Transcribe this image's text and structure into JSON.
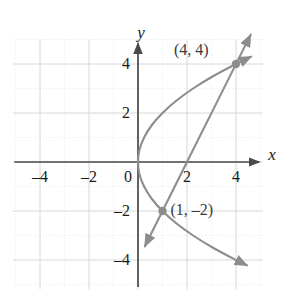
{
  "chart_data": {
    "type": "line",
    "title": "",
    "xlabel": "x",
    "ylabel": "y",
    "xlim": [
      -5.1,
      5.1
    ],
    "ylim": [
      -5.2,
      5.0
    ],
    "grid": true,
    "grid_major_step": 2,
    "grid_minor_step": 1,
    "legend": "none",
    "x_ticks": [
      {
        "value": -4,
        "label": "–4"
      },
      {
        "value": -2,
        "label": "–2"
      },
      {
        "value": 0,
        "label": "0"
      },
      {
        "value": 2,
        "label": "2"
      },
      {
        "value": 4,
        "label": "4"
      }
    ],
    "y_ticks": [
      {
        "value": 4,
        "label": "4"
      },
      {
        "value": 2,
        "label": "2"
      },
      {
        "value": -2,
        "label": "–2"
      },
      {
        "value": -4,
        "label": "–4"
      }
    ],
    "series": [
      {
        "name": "parabola",
        "type": "curve",
        "equation": "x = y^2 / 4",
        "color": "#8d8d8d",
        "arrow_start": true,
        "arrow_end": true,
        "points": [
          {
            "x": 4.45,
            "y": -4.22
          },
          {
            "x": 4.0,
            "y": -4.0
          },
          {
            "x": 3.06,
            "y": -3.5
          },
          {
            "x": 2.25,
            "y": -3.0
          },
          {
            "x": 1.56,
            "y": -2.5
          },
          {
            "x": 1.0,
            "y": -2.0
          },
          {
            "x": 0.56,
            "y": -1.5
          },
          {
            "x": 0.25,
            "y": -1.0
          },
          {
            "x": 0.06,
            "y": -0.5
          },
          {
            "x": 0.0,
            "y": 0.0
          },
          {
            "x": 0.06,
            "y": 0.5
          },
          {
            "x": 0.25,
            "y": 1.0
          },
          {
            "x": 0.56,
            "y": 1.5
          },
          {
            "x": 1.0,
            "y": 2.0
          },
          {
            "x": 1.56,
            "y": 2.5
          },
          {
            "x": 2.25,
            "y": 3.0
          },
          {
            "x": 3.06,
            "y": 3.5
          },
          {
            "x": 4.0,
            "y": 4.0
          },
          {
            "x": 4.62,
            "y": 4.3
          }
        ]
      },
      {
        "name": "line",
        "type": "line",
        "equation": "y = 2x - 4",
        "color": "#8d8d8d",
        "arrow_start": true,
        "arrow_end": true,
        "points": [
          {
            "x": 0.28,
            "y": -3.44
          },
          {
            "x": 4.6,
            "y": 5.2
          }
        ]
      }
    ],
    "annotations": [
      {
        "name": "intersection-point-upper",
        "label": "(4, 4)",
        "x": 4,
        "y": 4,
        "marker": true,
        "label_dx": -62,
        "label_dy": -22
      },
      {
        "name": "intersection-point-lower",
        "label": "(1, –2)",
        "x": 1,
        "y": -2,
        "marker": true,
        "label_dx": 8,
        "label_dy": -9
      }
    ],
    "colors": {
      "axis": "#4a4a4a",
      "curve": "#8d8d8d",
      "marker": "#8d8d8d",
      "grid_major": "#d8d8d8",
      "grid_minor": "#e8e8e8",
      "text": "#1a1a1a",
      "background": "#ffffff"
    }
  }
}
